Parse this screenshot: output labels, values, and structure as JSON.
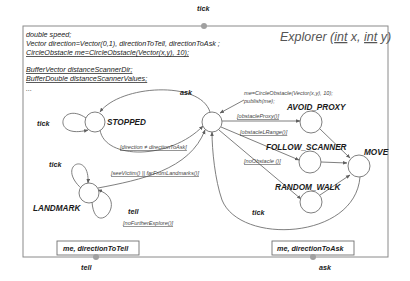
{
  "diagram": {
    "title": {
      "prefix": "Explorer (",
      "param1_type": "int",
      "param1_name": " x, ",
      "param2_type": "int",
      "param2_name": " y)"
    },
    "declarations": [
      "double speed;",
      "Vector direction=Vector(0,1), directionToTell, directionToAsk ;",
      "CircleObstacle me=CircleObstacle(Vector(x,y), 10);",
      "",
      "BufferVector distanceScannerDir;",
      "BufferDouble distanceScannerValues;",
      "..."
    ],
    "ports": {
      "top": {
        "label": "tick"
      },
      "bottom_left": {
        "label": "tell",
        "box": "me, directionToTell"
      },
      "bottom_right": {
        "label": "ask",
        "box": "me, directionToAsk"
      }
    },
    "states": [
      {
        "id": "stopped",
        "label": "STOPPED"
      },
      {
        "id": "hub",
        "label": ""
      },
      {
        "id": "avoid_proxy",
        "label": "AVOID_PROXY"
      },
      {
        "id": "follow_scanner",
        "label": "FOLLOW_SCANNER"
      },
      {
        "id": "random_walk",
        "label": "RANDOM_WALK"
      },
      {
        "id": "move",
        "label": "MOVE"
      },
      {
        "id": "landmark",
        "label": "LANDMARK"
      }
    ],
    "transitions": {
      "stopped_self": "tick",
      "stopped_to_hub": "ask",
      "hub_to_stopped_guard": "[direction ≠ directionToAsk]",
      "hub_action_line1": "me=CircleObstacle(Vector(x,y), 10);",
      "hub_action_line2": "publish(me);",
      "to_avoid_proxy": "[obstacleProxy()]",
      "to_follow_scanner": "[obstacleLRange()]",
      "to_random_walk": "[noObstacle ()]",
      "landmark_to_hub": "[seeVictim() || farFromLandmarks()]",
      "landmark_self_tick": "tick",
      "landmark_self_tell": "tell",
      "landmark_tell_guard": "[noFurtherExplore()]",
      "move_to_hub": "tick"
    }
  }
}
